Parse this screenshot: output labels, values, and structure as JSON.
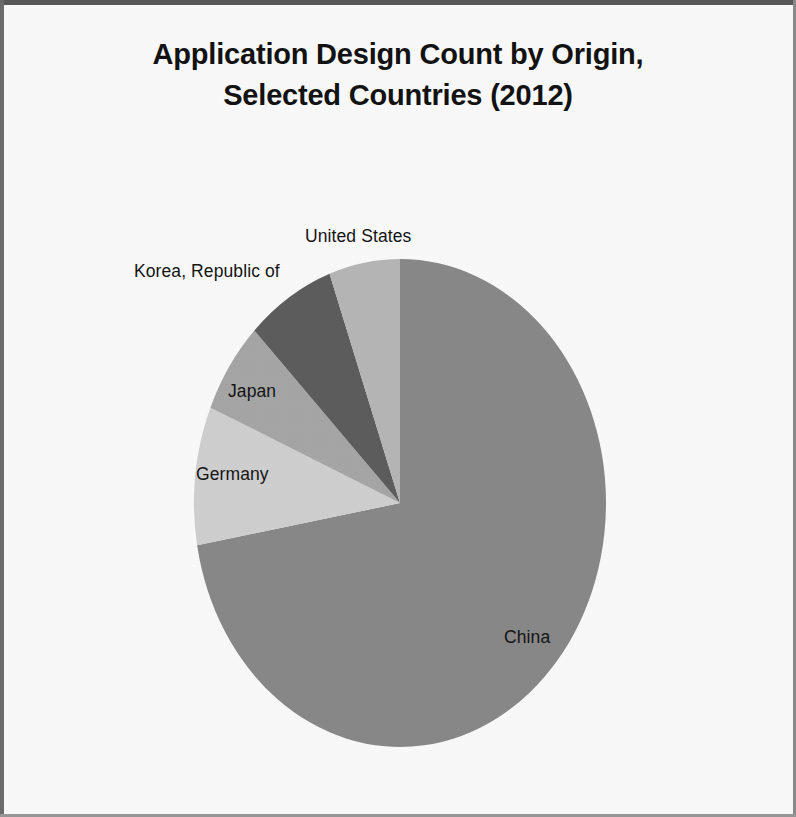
{
  "figure": {
    "title_line_1": "Application Design Count by Origin,",
    "title_line_2": "Selected Countries (2012)"
  },
  "labels": {
    "united_states": "United States",
    "korea": "Korea, Republic of",
    "japan": "Japan",
    "germany": "Germany",
    "china": "China"
  },
  "chart_data": {
    "type": "pie",
    "title": "Application Design Count by Origin, Selected Countries (2012)",
    "subtitle": "",
    "xlabel": "",
    "ylabel": "",
    "legend_position": "none",
    "labels_position": "outside-and-inside-callouts",
    "grid": false,
    "start_angle_deg": 90,
    "direction": "clockwise",
    "categories": [
      "China",
      "Germany",
      "Japan",
      "Korea, Republic of",
      "United States"
    ],
    "values": [
      72.2,
      9.2,
      6.1,
      7.0,
      5.5
    ],
    "value_unit": "percent of selected-country total",
    "slices": [
      {
        "label": "China",
        "percent": 72.2,
        "sweep_deg": 260.0,
        "start_deg": 90,
        "end_deg": -170,
        "color": "#8a8a8a"
      },
      {
        "label": "Germany",
        "percent": 9.2,
        "sweep_deg": 33.0,
        "start_deg": 190,
        "end_deg": 157,
        "color": "#d2d2d2"
      },
      {
        "label": "Japan",
        "percent": 6.1,
        "sweep_deg": 22.0,
        "start_deg": 157,
        "end_deg": 135,
        "color": "#a8a8a8"
      },
      {
        "label": "Korea, Republic of",
        "percent": 7.0,
        "sweep_deg": 25.0,
        "start_deg": 135,
        "end_deg": 110,
        "color": "#5e5e5e"
      },
      {
        "label": "United States",
        "percent": 5.5,
        "sweep_deg": 20.0,
        "start_deg": 110,
        "end_deg": 90,
        "color": "#b8b8b8"
      }
    ]
  },
  "geometry": {
    "center_x": 400,
    "center_y": 503,
    "radius_x": 206,
    "radius_y": 244
  }
}
